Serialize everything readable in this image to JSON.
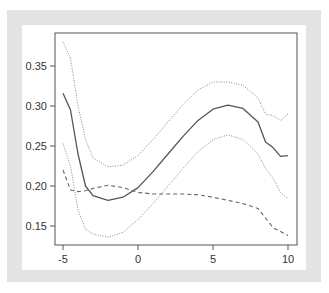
{
  "chart_data": {
    "type": "line",
    "title": "",
    "xlabel": "",
    "ylabel": "",
    "xlim": [
      -5.6,
      10.5
    ],
    "ylim": [
      0.126,
      0.39
    ],
    "grid": false,
    "legend": null,
    "x_ticks": [
      -5,
      0,
      5,
      10
    ],
    "x_tick_labels": [
      "-5",
      "0",
      "5",
      "10"
    ],
    "y_ticks": [
      0.15,
      0.2,
      0.25,
      0.3,
      0.35
    ],
    "y_tick_labels": [
      "0.15",
      "0.20",
      "0.25",
      "0.30",
      "0.35"
    ],
    "x": [
      -5,
      -4.5,
      -4,
      -3.5,
      -3,
      -2,
      -1,
      0,
      1,
      2,
      3,
      4,
      5,
      6,
      7,
      8,
      8.5,
      9,
      9.5,
      10
    ],
    "series": [
      {
        "name": "estimate",
        "style": "solid",
        "color": "#555555",
        "values": [
          0.316,
          0.295,
          0.24,
          0.2,
          0.188,
          0.182,
          0.186,
          0.198,
          0.218,
          0.24,
          0.262,
          0.282,
          0.296,
          0.301,
          0.297,
          0.28,
          0.255,
          0.248,
          0.237,
          0.238
        ]
      },
      {
        "name": "upper band",
        "style": "dotted",
        "color": "#888888",
        "values": [
          0.38,
          0.36,
          0.3,
          0.258,
          0.235,
          0.224,
          0.226,
          0.238,
          0.258,
          0.28,
          0.302,
          0.32,
          0.33,
          0.33,
          0.326,
          0.31,
          0.29,
          0.288,
          0.282,
          0.29
        ]
      },
      {
        "name": "lower band",
        "style": "dotted",
        "color": "#888888",
        "values": [
          0.253,
          0.225,
          0.17,
          0.146,
          0.14,
          0.136,
          0.142,
          0.158,
          0.178,
          0.2,
          0.222,
          0.243,
          0.258,
          0.264,
          0.258,
          0.24,
          0.222,
          0.21,
          0.192,
          0.184
        ]
      },
      {
        "name": "dashed reference",
        "style": "dashed",
        "color": "#666666",
        "values": [
          0.22,
          0.195,
          0.193,
          0.194,
          0.197,
          0.201,
          0.198,
          0.192,
          0.19,
          0.19,
          0.19,
          0.189,
          0.186,
          0.182,
          0.178,
          0.172,
          0.16,
          0.148,
          0.143,
          0.138
        ]
      }
    ]
  }
}
